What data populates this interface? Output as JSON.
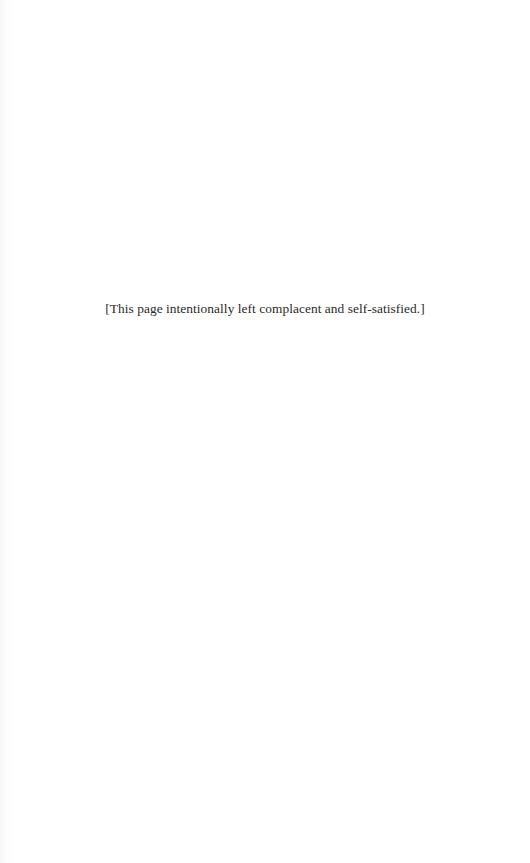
{
  "page": {
    "background_color": "#ffffff",
    "text_color": "#2a2a2a",
    "note": "[This page intentionally left complacent and self-satisfied.]"
  }
}
